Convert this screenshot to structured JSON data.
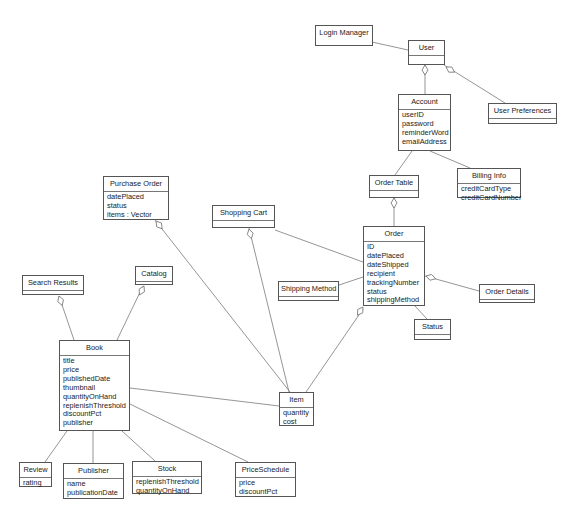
{
  "diagram": {
    "type": "UML class diagram",
    "classes": [
      {
        "id": "login-manager",
        "name": "Login Manager",
        "attributes": [],
        "box": [
          315,
          25,
          58,
          21
        ],
        "nameOnly": true
      },
      {
        "id": "user",
        "name": "User",
        "attributes": [],
        "box": [
          408,
          40,
          37,
          25
        ]
      },
      {
        "id": "account",
        "name": "Account",
        "attributes": [
          "userID",
          "password",
          "reminderWord",
          "emailAddress"
        ],
        "box": [
          398,
          94,
          53,
          57
        ]
      },
      {
        "id": "user-preferences",
        "name": "User Preferences",
        "attributes": [],
        "box": [
          488,
          103,
          69,
          21
        ]
      },
      {
        "id": "billing-info",
        "name": "Billing Info",
        "attributes": [
          "creditCardType",
          "creditCardNumber"
        ],
        "box": [
          457,
          168,
          64,
          30
        ]
      },
      {
        "id": "order-table",
        "name": "Order Table",
        "attributes": [],
        "box": [
          369,
          175,
          50,
          23
        ]
      },
      {
        "id": "purchase-order",
        "name": "Purchase Order",
        "attributes": [
          "datePlaced",
          "status",
          "items : Vector"
        ],
        "box": [
          103,
          176,
          66,
          44
        ]
      },
      {
        "id": "shopping-cart",
        "name": "Shopping Cart",
        "attributes": [],
        "box": [
          212,
          205,
          63,
          23
        ]
      },
      {
        "id": "order",
        "name": "Order",
        "attributes": [
          "ID",
          "datePlaced",
          "dateShipped",
          "recipient",
          "trackingNumber",
          "status",
          "shippingMethod"
        ],
        "box": [
          363,
          226,
          62,
          80
        ]
      },
      {
        "id": "shipping-method",
        "name": "Shipping Method",
        "attributes": [],
        "box": [
          278,
          281,
          61,
          20
        ]
      },
      {
        "id": "order-details",
        "name": "Order Details",
        "attributes": [],
        "box": [
          479,
          284,
          56,
          19
        ]
      },
      {
        "id": "status",
        "name": "Status",
        "attributes": [],
        "box": [
          414,
          319,
          37,
          21
        ]
      },
      {
        "id": "search-results",
        "name": "Search Results",
        "attributes": [],
        "box": [
          22,
          275,
          62,
          20
        ]
      },
      {
        "id": "catalog",
        "name": "Catalog",
        "attributes": [],
        "box": [
          135,
          266,
          38,
          19
        ]
      },
      {
        "id": "book",
        "name": "Book",
        "attributes": [
          "title",
          "price",
          "publishedDate",
          "thumbnail",
          "quantityOnHand",
          "replenishThreshold",
          "discountPct",
          "publisher"
        ],
        "box": [
          59,
          340,
          71,
          91
        ]
      },
      {
        "id": "item",
        "name": "Item",
        "attributes": [
          "quantity",
          "cost"
        ],
        "box": [
          279,
          392,
          35,
          34
        ]
      },
      {
        "id": "review",
        "name": "Review",
        "attributes": [
          "rating"
        ],
        "box": [
          19,
          462,
          33,
          25
        ]
      },
      {
        "id": "publisher",
        "name": "Publisher",
        "attributes": [
          "name",
          "publicationDate"
        ],
        "box": [
          63,
          463,
          61,
          36
        ]
      },
      {
        "id": "stock",
        "name": "Stock",
        "attributes": [
          "replenishThreshold",
          "quantityOnHand"
        ],
        "box": [
          132,
          461,
          70,
          33
        ]
      },
      {
        "id": "price-schedule",
        "name": "PriceSchedule",
        "attributes": [
          "price",
          "discountPct"
        ],
        "box": [
          235,
          462,
          61,
          35
        ]
      }
    ],
    "relationships": [
      {
        "from": "login-manager",
        "to": "user",
        "kind": "association",
        "line": [
          372,
          42,
          408,
          50
        ]
      },
      {
        "from": "user",
        "to": "account",
        "kind": "aggregation",
        "diamondAt": "user",
        "line": [
          425,
          65,
          425,
          94
        ],
        "diamond": [
          425,
          65
        ]
      },
      {
        "from": "user",
        "to": "user-preferences",
        "kind": "aggregation",
        "diamondAt": "user",
        "line": [
          444,
          65,
          505,
          103
        ],
        "diamond": [
          446,
          67
        ]
      },
      {
        "from": "account",
        "to": "order-table",
        "kind": "association",
        "line": [
          412,
          151,
          395,
          175
        ]
      },
      {
        "from": "account",
        "to": "billing-info",
        "kind": "association",
        "line": [
          430,
          151,
          470,
          168
        ]
      },
      {
        "from": "order-table",
        "to": "order",
        "kind": "aggregation",
        "diamondAt": "order-table",
        "line": [
          394,
          198,
          394,
          226
        ],
        "diamond": [
          394,
          198
        ]
      },
      {
        "from": "shopping-cart",
        "to": "order",
        "kind": "association",
        "line": [
          275,
          230,
          363,
          262
        ]
      },
      {
        "from": "order",
        "to": "shipping-method",
        "kind": "association",
        "line": [
          363,
          277,
          339,
          285
        ]
      },
      {
        "from": "order",
        "to": "order-details",
        "kind": "aggregation",
        "diamondAt": "order",
        "line": [
          425,
          276,
          479,
          291
        ],
        "diamond": [
          426,
          276
        ]
      },
      {
        "from": "order",
        "to": "status",
        "kind": "association",
        "line": [
          415,
          306,
          427,
          319
        ]
      },
      {
        "from": "purchase-order",
        "to": "item",
        "kind": "aggregation",
        "diamondAt": "purchase-order",
        "line": [
          155,
          220,
          290,
          392
        ],
        "diamond": [
          156,
          221
        ]
      },
      {
        "from": "shopping-cart",
        "to": "item",
        "kind": "aggregation",
        "diamondAt": "shopping-cart",
        "line": [
          249,
          228,
          289,
          392
        ],
        "diamond": [
          249,
          229
        ]
      },
      {
        "from": "order",
        "to": "item",
        "kind": "aggregation",
        "diamondAt": "order",
        "line": [
          363,
          309,
          306,
          392
        ],
        "diamond": [
          363,
          307
        ]
      },
      {
        "from": "search-results",
        "to": "book",
        "kind": "aggregation",
        "diamondAt": "search-results",
        "line": [
          59,
          296,
          74,
          340
        ],
        "diamond": [
          59,
          296
        ]
      },
      {
        "from": "catalog",
        "to": "book",
        "kind": "aggregation",
        "diamondAt": "catalog",
        "line": [
          143,
          286,
          117,
          340
        ],
        "diamond": [
          144,
          286
        ]
      },
      {
        "from": "book",
        "to": "item",
        "kind": "association",
        "line": [
          130,
          388,
          279,
          406
        ]
      },
      {
        "from": "book",
        "to": "review",
        "kind": "association",
        "line": [
          67,
          431,
          45,
          462
        ]
      },
      {
        "from": "book",
        "to": "publisher",
        "kind": "association",
        "line": [
          93,
          431,
          93,
          463
        ]
      },
      {
        "from": "book",
        "to": "stock",
        "kind": "association",
        "line": [
          122,
          431,
          155,
          461
        ]
      },
      {
        "from": "book",
        "to": "price-schedule",
        "kind": "association",
        "line": [
          130,
          404,
          248,
          462
        ]
      }
    ]
  },
  "colors": {
    "background": "#ffffff",
    "border": "#555555",
    "line": "#7a7a7a",
    "text": "#1a1a1a"
  }
}
